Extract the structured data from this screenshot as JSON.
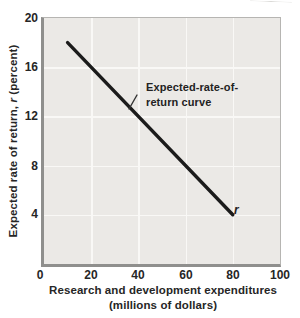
{
  "chart_data": {
    "type": "line",
    "title": "",
    "xlabel_line1": "Research and development expenditures",
    "xlabel_line2": "(millions of dollars)",
    "ylabel_prefix": "Expected rate of return, ",
    "ylabel_var": "r",
    "ylabel_suffix": " (percent)",
    "xlim": [
      0,
      100
    ],
    "ylim": [
      0,
      20
    ],
    "xticks": [
      0,
      20,
      40,
      60,
      80,
      100
    ],
    "yticks": [
      4,
      8,
      12,
      16,
      20
    ],
    "xtick_labels": [
      "0",
      "20",
      "40",
      "60",
      "80",
      "100"
    ],
    "ytick_labels_top_to_bottom": [
      "20",
      "16",
      "12",
      "8",
      "4"
    ],
    "grid": true,
    "legend": "none",
    "series": [
      {
        "name": "Expected-rate-of-return curve",
        "points": [
          [
            10,
            18
          ],
          [
            80,
            4
          ]
        ],
        "color": "#1b1b1b",
        "end_label": "r"
      }
    ],
    "annotation": {
      "line1": "Expected-rate-of-",
      "line2": "return curve"
    },
    "curve_end_label": "r",
    "colors": {
      "plot_bg": "#ebe9e6",
      "gridline": "#f9f8f6",
      "axis_border_dark": "#8f8f8d",
      "axis_border_light": "#b6b5b2",
      "curve": "#1b1b1b",
      "text": "#262626"
    }
  }
}
